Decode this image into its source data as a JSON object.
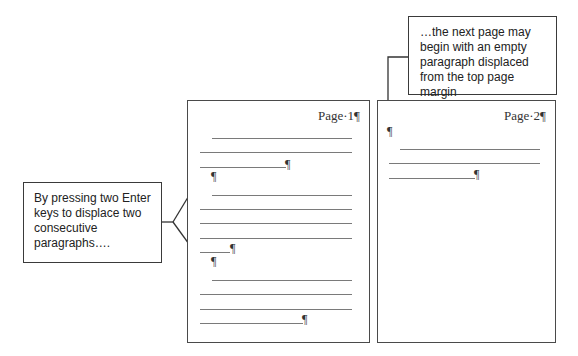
{
  "diagram": {
    "callouts": {
      "left": {
        "text": "By pressing two Enter keys to displace two consecutive paragraphs…."
      },
      "right": {
        "text": "…the next page may begin with an empty paragraph displaced from the top page margin"
      }
    },
    "pages": [
      {
        "header": "Page·1¶",
        "pilcrow": "¶"
      },
      {
        "header": "Page·2¶",
        "pilcrow": "¶"
      }
    ]
  },
  "colors": {
    "border": "#4a4a4a",
    "text_line": "#7a7a7a",
    "background": "#ffffff"
  }
}
